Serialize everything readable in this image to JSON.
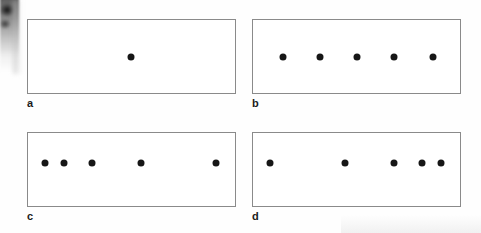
{
  "figure": {
    "width": 481,
    "height": 233,
    "background_color": "#fefefe",
    "box_border_color": "#8a8a8a",
    "dot_color": "#161616",
    "dot_diameter": 7,
    "artifact": {
      "name": "scan-edge-shadow",
      "description": "dark book-edge scanning shadow at left margin"
    }
  },
  "panels": [
    {
      "label": "a",
      "box": {
        "x": 27,
        "y": 19,
        "width": 209,
        "height": 75
      },
      "label_pos": {
        "x": 27,
        "y": 98
      },
      "dot_count": 1,
      "pattern": "single",
      "dots": [
        {
          "x": 131,
          "y": 57
        }
      ]
    },
    {
      "label": "b",
      "box": {
        "x": 252,
        "y": 19,
        "width": 209,
        "height": 75
      },
      "label_pos": {
        "x": 252,
        "y": 98
      },
      "dot_count": 5,
      "pattern": "uniform",
      "dots": [
        {
          "x": 283,
          "y": 57
        },
        {
          "x": 320,
          "y": 57
        },
        {
          "x": 357,
          "y": 57
        },
        {
          "x": 394,
          "y": 57
        },
        {
          "x": 433,
          "y": 57
        }
      ]
    },
    {
      "label": "c",
      "box": {
        "x": 27,
        "y": 132,
        "width": 209,
        "height": 75
      },
      "label_pos": {
        "x": 27,
        "y": 211
      },
      "dot_count": 5,
      "pattern": "clustered-left",
      "dots": [
        {
          "x": 45,
          "y": 163
        },
        {
          "x": 64,
          "y": 163
        },
        {
          "x": 92,
          "y": 163
        },
        {
          "x": 141,
          "y": 163
        },
        {
          "x": 216,
          "y": 163
        }
      ]
    },
    {
      "label": "d",
      "box": {
        "x": 252,
        "y": 132,
        "width": 209,
        "height": 75
      },
      "label_pos": {
        "x": 252,
        "y": 211
      },
      "dot_count": 5,
      "pattern": "clustered-right",
      "dots": [
        {
          "x": 270,
          "y": 163
        },
        {
          "x": 345,
          "y": 163
        },
        {
          "x": 394,
          "y": 163
        },
        {
          "x": 422,
          "y": 163
        },
        {
          "x": 441,
          "y": 163
        }
      ]
    }
  ]
}
